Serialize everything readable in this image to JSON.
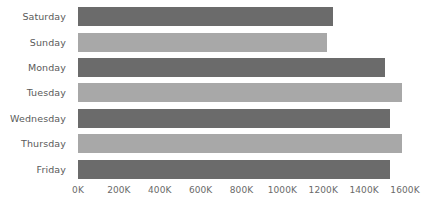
{
  "chart_data": {
    "type": "bar",
    "orientation": "horizontal",
    "title": "",
    "subtitle": "",
    "xlabel": "",
    "ylabel": "",
    "categories": [
      "Saturday",
      "Sunday",
      "Monday",
      "Tuesday",
      "Wednesday",
      "Thursday",
      "Friday"
    ],
    "values": [
      1250000,
      1220000,
      1500000,
      1585000,
      1525000,
      1585000,
      1525000
    ],
    "series": [
      {
        "name": "Value",
        "values": [
          1250000,
          1220000,
          1500000,
          1585000,
          1525000,
          1585000,
          1525000
        ]
      }
    ],
    "bar_colors": [
      "#6b6b6b",
      "#a8a8a8",
      "#6b6b6b",
      "#a8a8a8",
      "#6b6b6b",
      "#a8a8a8",
      "#6b6b6b"
    ],
    "xlim": [
      0,
      1600000
    ],
    "xtick_values": [
      0,
      200000,
      400000,
      600000,
      800000,
      1000000,
      1200000,
      1400000,
      1600000
    ],
    "xtick_labels": [
      "0K",
      "200K",
      "400K",
      "600K",
      "800K",
      "1000K",
      "1200K",
      "1400K",
      "1600K"
    ],
    "grid": false,
    "legend": false,
    "legend_position": "none",
    "background_color": "#ffffff",
    "tick_label_color": "#6a6a6a",
    "category_label_color": "#5a5a5a"
  },
  "bars": [
    {
      "label": "Saturday",
      "value": 1250000,
      "color": "#6b6b6b"
    },
    {
      "label": "Sunday",
      "value": 1220000,
      "color": "#a8a8a8"
    },
    {
      "label": "Monday",
      "value": 1500000,
      "color": "#6b6b6b"
    },
    {
      "label": "Tuesday",
      "value": 1585000,
      "color": "#a8a8a8"
    },
    {
      "label": "Wednesday",
      "value": 1525000,
      "color": "#6b6b6b"
    },
    {
      "label": "Thursday",
      "value": 1585000,
      "color": "#a8a8a8"
    },
    {
      "label": "Friday",
      "value": 1525000,
      "color": "#6b6b6b"
    }
  ],
  "xticks": [
    {
      "label": "0K",
      "value": 0
    },
    {
      "label": "200K",
      "value": 200000
    },
    {
      "label": "400K",
      "value": 400000
    },
    {
      "label": "600K",
      "value": 600000
    },
    {
      "label": "800K",
      "value": 800000
    },
    {
      "label": "1000K",
      "value": 1000000
    },
    {
      "label": "1200K",
      "value": 1200000
    },
    {
      "label": "1400K",
      "value": 1400000
    },
    {
      "label": "1600K",
      "value": 1600000
    }
  ]
}
